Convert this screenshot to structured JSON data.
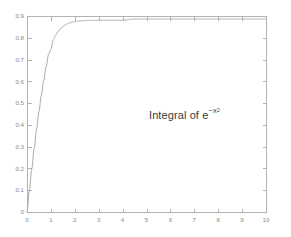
{
  "figure": {
    "background_color": "#ffffff",
    "axis_color": "#b4b4b4",
    "curve_color": "#aaaaaa",
    "tick_label_color": "#8a8a8a",
    "annotation_color": "#3a3a3a"
  },
  "annotation": {
    "prefix": "Integral of e",
    "exponent_base": "−x",
    "exponent_power": "2",
    "full_text": "Integral of e^(-x^2)"
  },
  "chart_data": {
    "type": "line",
    "title": "",
    "subtitle": "",
    "xlabel": "",
    "ylabel": "",
    "xlim": [
      0,
      10
    ],
    "ylim": [
      0,
      0.9
    ],
    "grid": false,
    "legend": false,
    "legend_position": "none",
    "annotations": [
      {
        "text": "Integral of e^(-x^2)",
        "x": 5.15,
        "y": 0.445
      }
    ],
    "xticks": [
      0,
      1,
      2,
      3,
      4,
      5,
      6,
      7,
      8,
      9,
      10
    ],
    "xticklabels": [
      "0",
      "1",
      "2",
      "3",
      "4",
      "5",
      "6",
      "7",
      "8",
      "9",
      "10"
    ],
    "yticks": [
      0,
      0.1,
      0.2,
      0.3,
      0.4,
      0.5,
      0.6,
      0.7,
      0.8,
      0.9
    ],
    "yticklabels": [
      "0",
      "0.1",
      "0.2",
      "0.3",
      "0.4",
      "0.5",
      "0.6",
      "0.7",
      "0.8",
      "0.9"
    ],
    "series": [
      {
        "name": "Integral of e^(-x^2)",
        "color": "#aaaaaa",
        "x": [
          0,
          0.1,
          0.2,
          0.3,
          0.4,
          0.5,
          0.6,
          0.7,
          0.8,
          0.9,
          1.0,
          1.1,
          1.2,
          1.3,
          1.4,
          1.5,
          1.6,
          1.7,
          1.8,
          1.9,
          2.0,
          2.2,
          2.4,
          2.6,
          2.8,
          3.0,
          3.5,
          4.0,
          4.5,
          5.0,
          5.5,
          6.0,
          6.5,
          7.0,
          7.5,
          8.0,
          8.5,
          9.0,
          9.5,
          10.0
        ],
        "values": [
          0,
          0.09967,
          0.19736,
          0.29114,
          0.37938,
          0.46128,
          0.5365,
          0.60504,
          0.66712,
          0.72316,
          0.74682,
          0.79091,
          0.81156,
          0.82806,
          0.84105,
          0.85112,
          0.85881,
          0.8646,
          0.86892,
          0.87209,
          0.87441,
          0.87733,
          0.87893,
          0.87978,
          0.88021,
          0.88042,
          0.8806,
          0.88062,
          0.88623,
          0.88623,
          0.88623,
          0.88623,
          0.88623,
          0.88623,
          0.88623,
          0.88623,
          0.88623,
          0.88623,
          0.88623,
          0.88623
        ],
        "asymptote": 0.886227
      }
    ]
  },
  "axes_geometry": {
    "left_px": 27,
    "right_px": 266,
    "top_px": 16,
    "bottom_px": 212
  }
}
